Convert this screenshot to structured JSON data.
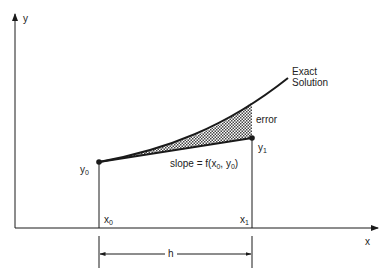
{
  "diagram": {
    "axes": {
      "x_label": "x",
      "y_label": "y"
    },
    "points": {
      "x0": {
        "base": "x",
        "sub": "0"
      },
      "x1": {
        "base": "x",
        "sub": "1"
      },
      "y0": {
        "base": "y",
        "sub": "0"
      },
      "y1": {
        "base": "y",
        "sub": "1"
      }
    },
    "curve_label_line1": "Exact",
    "curve_label_line2": "Solution",
    "error_label": "error",
    "slope_label": "slope = f(x",
    "slope_sub0": "0",
    "slope_mid": ", y",
    "slope_sub1": "0",
    "slope_end": ")",
    "step_label": "h",
    "colors": {
      "line": "#1a1a1a",
      "hatch": "#555555",
      "background": "#ffffff"
    }
  }
}
